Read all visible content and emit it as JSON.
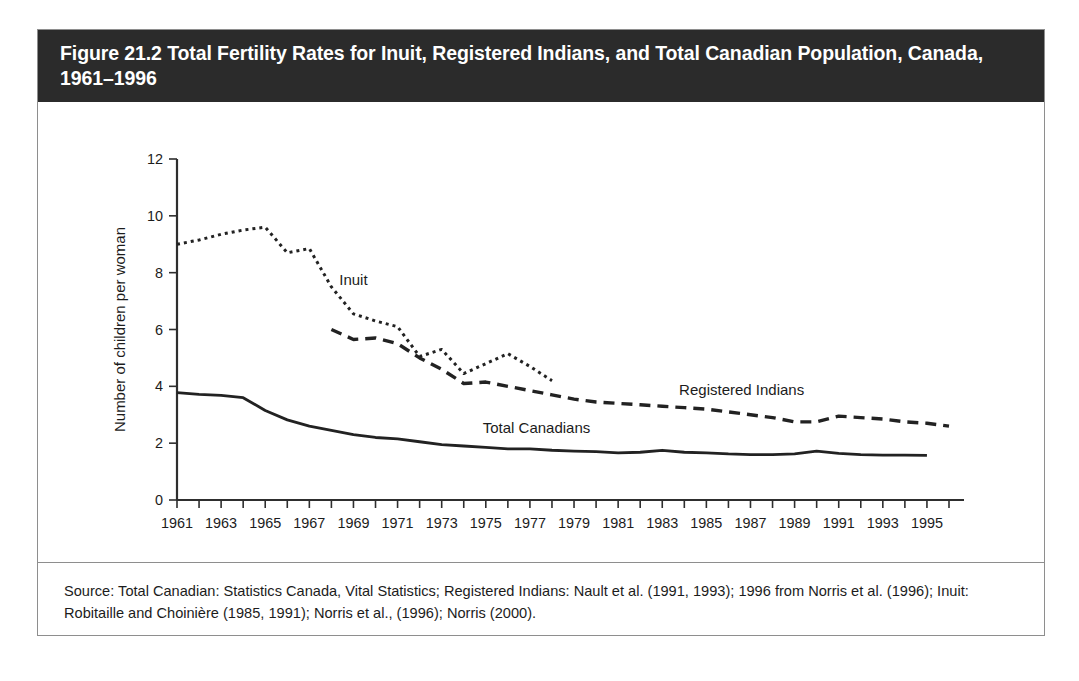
{
  "figure": {
    "title": "Figure 21.2 Total Fertility Rates for Inuit, Registered Indians, and Total Canadian Population, Canada, 1961–1996",
    "source": "Source: Total Canadian: Statistics Canada, Vital Statistics; Registered Indians: Nault et al. (1991, 1993); 1996 from Norris et al. (1996); Inuit: Robitaille and Choinière (1985, 1991); Norris et al., (1996); Norris (2000).",
    "border_color": "#8e8e8e",
    "title_bar_color": "#2b2b2b",
    "title_text_color": "#ffffff",
    "line_color": "#222222",
    "background_color": "#ffffff"
  },
  "chart_data": {
    "type": "line",
    "title": "Figure 21.2 Total Fertility Rates for Inuit, Registered Indians, and Total Canadian Population, Canada, 1961–1996",
    "xlabel": "",
    "ylabel": "Number of children per woman",
    "xlim": [
      1961,
      1996
    ],
    "ylim": [
      0,
      12
    ],
    "yticks": [
      0,
      2,
      4,
      6,
      8,
      10,
      12
    ],
    "yticklabels": [
      "0",
      "2",
      "4",
      "6",
      "8",
      "10",
      "12"
    ],
    "xticks": [
      1961,
      1963,
      1965,
      1967,
      1969,
      1971,
      1973,
      1975,
      1977,
      1979,
      1981,
      1983,
      1985,
      1987,
      1989,
      1991,
      1993,
      1995
    ],
    "xticklabels": [
      "1961",
      "1963",
      "1965",
      "1967",
      "1969",
      "1971",
      "1973",
      "1975",
      "1977",
      "1979",
      "1981",
      "1983",
      "1985",
      "1987",
      "1989",
      "1991",
      "1993",
      "1995"
    ],
    "x_minor_ticks_every": 1,
    "grid": false,
    "legend": "inline-labels",
    "series": [
      {
        "name": "Inuit",
        "style": "dotted",
        "dasharray": "3,4",
        "width": 3.0,
        "label_x": 1969.0,
        "label_y": 7.55,
        "x": [
          1961,
          1962,
          1963,
          1964,
          1965,
          1966,
          1967,
          1968,
          1969,
          1970,
          1971,
          1972,
          1973,
          1974,
          1975,
          1976,
          1977,
          1978
        ],
        "y": [
          9.0,
          9.15,
          9.35,
          9.5,
          9.6,
          8.7,
          8.85,
          7.5,
          6.55,
          6.3,
          6.1,
          5.05,
          5.3,
          4.45,
          4.8,
          5.15,
          4.7,
          4.2
        ]
      },
      {
        "name": "Registered Indians",
        "style": "dashed",
        "dasharray": "11,7",
        "width": 3.4,
        "label_x": 1986.6,
        "label_y": 3.7,
        "x": [
          1968,
          1969,
          1970,
          1971,
          1972,
          1973,
          1974,
          1975,
          1976,
          1977,
          1978,
          1979,
          1980,
          1981,
          1982,
          1983,
          1984,
          1985,
          1986,
          1987,
          1988,
          1989,
          1990,
          1991,
          1992,
          1993,
          1994,
          1995,
          1996
        ],
        "y": [
          6.0,
          5.65,
          5.7,
          5.5,
          5.0,
          4.6,
          4.1,
          4.15,
          4.0,
          3.85,
          3.7,
          3.55,
          3.45,
          3.4,
          3.35,
          3.3,
          3.25,
          3.2,
          3.1,
          3.0,
          2.9,
          2.75,
          2.75,
          2.95,
          2.9,
          2.85,
          2.75,
          2.7,
          2.6
        ]
      },
      {
        "name": "Total Canadians",
        "style": "solid",
        "dasharray": "none",
        "width": 2.8,
        "label_x": 1977.3,
        "label_y": 2.35,
        "x": [
          1961,
          1962,
          1963,
          1964,
          1965,
          1966,
          1967,
          1968,
          1969,
          1970,
          1971,
          1972,
          1973,
          1974,
          1975,
          1976,
          1977,
          1978,
          1979,
          1980,
          1981,
          1982,
          1983,
          1984,
          1985,
          1986,
          1987,
          1988,
          1989,
          1990,
          1991,
          1992,
          1993,
          1994,
          1995
        ],
        "y": [
          3.78,
          3.72,
          3.68,
          3.6,
          3.15,
          2.82,
          2.6,
          2.45,
          2.3,
          2.2,
          2.15,
          2.05,
          1.95,
          1.9,
          1.85,
          1.8,
          1.8,
          1.75,
          1.72,
          1.7,
          1.66,
          1.68,
          1.75,
          1.68,
          1.66,
          1.62,
          1.6,
          1.6,
          1.62,
          1.72,
          1.64,
          1.6,
          1.58,
          1.58,
          1.57
        ]
      }
    ],
    "annotations": [
      {
        "text": "Inuit",
        "x": 1969.0,
        "y": 7.55
      },
      {
        "text": "Registered Indians",
        "x": 1986.6,
        "y": 3.7
      },
      {
        "text": "Total Canadians",
        "x": 1977.3,
        "y": 2.35
      }
    ]
  }
}
